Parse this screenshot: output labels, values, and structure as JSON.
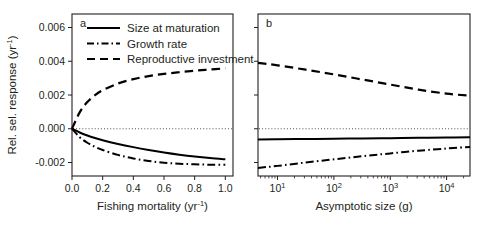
{
  "figure": {
    "ylabel_main": "Rel. sel. response (yr",
    "ylabel_sup": "-1",
    "ylabel_close": ")",
    "panel_a_letter": "a",
    "panel_b_letter": "b"
  },
  "legend": {
    "entries": [
      {
        "label": "Size at maturation",
        "style": "solid"
      },
      {
        "label": "Growth rate",
        "style": "dashdot"
      },
      {
        "label": "Reproductive investment",
        "style": "dashed"
      }
    ]
  },
  "yaxis": {
    "ticks": [
      "0.006",
      "0.004",
      "0.002",
      "0.000",
      "-0.002"
    ],
    "values": [
      0.006,
      0.004,
      0.002,
      0.0,
      -0.002
    ]
  },
  "panel_a": {
    "xlabel_main": "Fishing mortality (yr",
    "xlabel_sup": "-1",
    "xlabel_close": ")",
    "xticks": [
      "0.0",
      "0.2",
      "0.4",
      "0.6",
      "0.8",
      "1.0"
    ],
    "xtick_values": [
      0.0,
      0.2,
      0.4,
      0.6,
      0.8,
      1.0
    ]
  },
  "panel_b": {
    "xlabel": "Asymptotic size (g)",
    "xticks": [
      "10",
      "10",
      "10",
      "10"
    ],
    "xtick_sups": [
      "1",
      "2",
      "3",
      "4"
    ],
    "xtick_values": [
      10,
      100,
      1000,
      10000
    ]
  },
  "chart_data": {
    "type": "line",
    "title": "",
    "ylabel": "Rel. sel. response (yr^-1)",
    "ylim": [
      -0.0028,
      0.0068
    ],
    "grid": false,
    "zero_reference_line": 0.0,
    "legend_position": "top-left-panel-a",
    "panels": [
      {
        "id": "a",
        "xlabel": "Fishing mortality (yr^-1)",
        "xscale": "linear",
        "xlim": [
          0.0,
          1.05
        ],
        "x": [
          0.0,
          0.05,
          0.1,
          0.15,
          0.2,
          0.3,
          0.4,
          0.5,
          0.6,
          0.7,
          0.8,
          0.9,
          1.0
        ],
        "series": [
          {
            "name": "Size at maturation",
            "style": "solid",
            "values": [
              0.0,
              -0.00022,
              -0.0004,
              -0.00055,
              -0.00068,
              -0.0009,
              -0.00109,
              -0.00126,
              -0.00141,
              -0.00154,
              -0.00165,
              -0.00174,
              -0.00181
            ]
          },
          {
            "name": "Growth rate",
            "style": "dashdot",
            "values": [
              0.0,
              -0.0005,
              -0.00083,
              -0.00107,
              -0.00126,
              -0.00155,
              -0.00176,
              -0.00191,
              -0.00201,
              -0.00207,
              -0.00211,
              -0.00213,
              -0.00214
            ]
          },
          {
            "name": "Reproductive investment",
            "style": "dashed",
            "values": [
              0.0,
              0.00097,
              0.00158,
              0.00199,
              0.00228,
              0.00268,
              0.00294,
              0.00312,
              0.00325,
              0.00335,
              0.00344,
              0.00351,
              0.00358
            ]
          }
        ]
      },
      {
        "id": "b",
        "xlabel": "Asymptotic size (g)",
        "xscale": "log",
        "xlim": [
          4.5,
          26000
        ],
        "x": [
          4.5,
          10,
          31.6,
          100,
          316,
          1000,
          3160,
          10000,
          26000
        ],
        "series": [
          {
            "name": "Size at maturation",
            "style": "solid",
            "values": [
              -0.00063,
              -0.00062,
              -0.00061,
              -0.00059,
              -0.00058,
              -0.00056,
              -0.00054,
              -0.00052,
              -0.0005
            ]
          },
          {
            "name": "Growth rate",
            "style": "dashdot",
            "values": [
              -0.00232,
              -0.0022,
              -0.002,
              -0.00181,
              -0.00163,
              -0.00146,
              -0.0013,
              -0.00117,
              -0.00108
            ]
          },
          {
            "name": "Reproductive investment",
            "style": "dashed",
            "values": [
              0.0039,
              0.00376,
              0.0035,
              0.00322,
              0.00292,
              0.00262,
              0.00232,
              0.00208,
              0.00196
            ]
          }
        ]
      }
    ]
  }
}
